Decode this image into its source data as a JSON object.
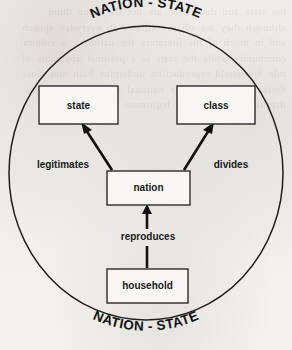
{
  "figure": {
    "background_color": "#f2f1ef",
    "ink_color": "#111111",
    "boundary_label_top": "NATION - STATE",
    "boundary_label_bottom": "NATION - STATE",
    "ghost_text": "the state and the nation are not the same thing although they are often conflated in everyday speech and in much of the literature the nation is a cultural community while the state is a political apparatus of rule household reproduction underpins both and class divisions cut across the national community in ways that the state seeks to legitimate and contain"
  },
  "nodes": [
    {
      "id": "state",
      "label": "state",
      "x": 39,
      "y": 86,
      "w": 79,
      "h": 38
    },
    {
      "id": "class",
      "label": "class",
      "x": 177,
      "y": 86,
      "w": 78,
      "h": 38
    },
    {
      "id": "nation",
      "label": "nation",
      "x": 107,
      "y": 171,
      "w": 83,
      "h": 34
    },
    {
      "id": "household",
      "label": "household",
      "x": 107,
      "y": 269,
      "w": 81,
      "h": 34
    }
  ],
  "edges": [
    {
      "id": "nation-to-state",
      "label": "legitimates",
      "from": "nation",
      "to": "state",
      "label_x": 63,
      "label_y": 165
    },
    {
      "id": "nation-to-class",
      "label": "divides",
      "from": "nation",
      "to": "class",
      "label_x": 231,
      "label_y": 165
    },
    {
      "id": "household-to-nation",
      "label": "reproduces",
      "from": "household",
      "to": "nation",
      "label_x": 148,
      "label_y": 237
    }
  ],
  "boundary": {
    "shape": "ellipse",
    "cx": 146,
    "cy": 173,
    "rx": 137,
    "ry": 147
  }
}
